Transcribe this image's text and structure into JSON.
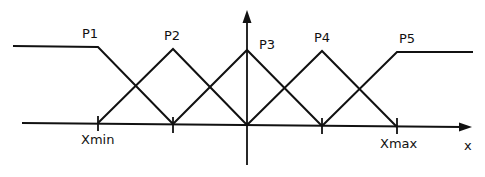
{
  "diagram": {
    "type": "fuzzy-membership-functions",
    "axis_label_x": "x",
    "tick_labels": {
      "xmin": "Xmin",
      "xmax": "Xmax"
    },
    "sets": [
      {
        "label": "P1",
        "shape": "left-shoulder"
      },
      {
        "label": "P2",
        "shape": "triangle"
      },
      {
        "label": "P3",
        "shape": "triangle"
      },
      {
        "label": "P4",
        "shape": "triangle"
      },
      {
        "label": "P5",
        "shape": "right-shoulder"
      }
    ],
    "stroke_color": "#111111",
    "background_color": "#ffffff"
  }
}
